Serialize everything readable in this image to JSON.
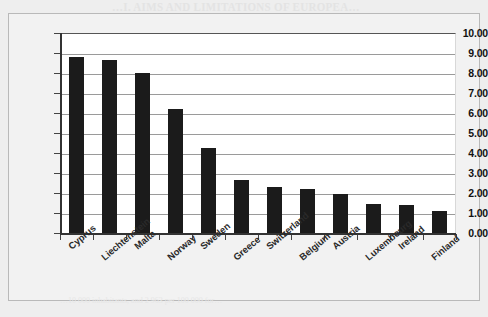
{
  "page": {
    "bleed_header": "…I. AIMS AND LIMITATIONS OF EUROPEA…",
    "bleed_subheader": "…AND PUBLIC POLICY…",
    "bleed_footer": "…10 000 inhabitants, and 2 963 per 100 000 for…"
  },
  "chart_data": {
    "type": "bar",
    "title": "",
    "subtitle": "",
    "xlabel": "",
    "ylabel": "",
    "categories": [
      "Cyprus",
      "Liechtenstein",
      "Malta",
      "Norway",
      "Sweden",
      "Greece",
      "Switzerland",
      "Belgium",
      "Austria",
      "Luxembourg",
      "Ireland",
      "Finland"
    ],
    "values": [
      8.8,
      8.65,
      8.0,
      6.2,
      4.25,
      2.65,
      2.3,
      2.2,
      1.95,
      1.45,
      1.4,
      1.1
    ],
    "ylim": [
      0,
      10
    ],
    "ytick_step": 1,
    "ytick_labels": [
      "10.00",
      "9.00",
      "8.00",
      "7.00",
      "6.00",
      "5.00",
      "4.00",
      "3.00",
      "2.00",
      "1.00",
      "0.00"
    ],
    "grid": true,
    "legend": "none",
    "bar_color": "#1b1b1b",
    "plot_background": "#ffffff",
    "grid_color": "#9a9a9a",
    "axis_color": "#333333",
    "label_rotation_deg": -40
  }
}
